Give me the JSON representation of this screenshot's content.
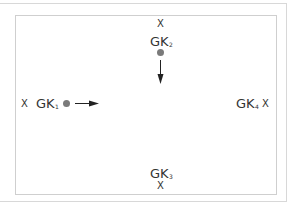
{
  "diagram": {
    "colors": {
      "text": "#333333",
      "dot": "#7a7a7a",
      "frame": "#cfcfcf",
      "arrow": "#222222"
    },
    "markers": [
      {
        "id": "gk1",
        "label": "GK",
        "subscript": "1",
        "position": "left",
        "x_mark": "X",
        "has_dot": true,
        "arrow": "right"
      },
      {
        "id": "gk2",
        "label": "GK",
        "subscript": "2",
        "position": "top",
        "x_mark": "X",
        "has_dot": true,
        "arrow": "down"
      },
      {
        "id": "gk3",
        "label": "GK",
        "subscript": "3",
        "position": "bottom",
        "x_mark": "X",
        "has_dot": false,
        "arrow": null
      },
      {
        "id": "gk4",
        "label": "GK",
        "subscript": "4",
        "position": "right",
        "x_mark": "X",
        "has_dot": false,
        "arrow": null
      }
    ]
  }
}
